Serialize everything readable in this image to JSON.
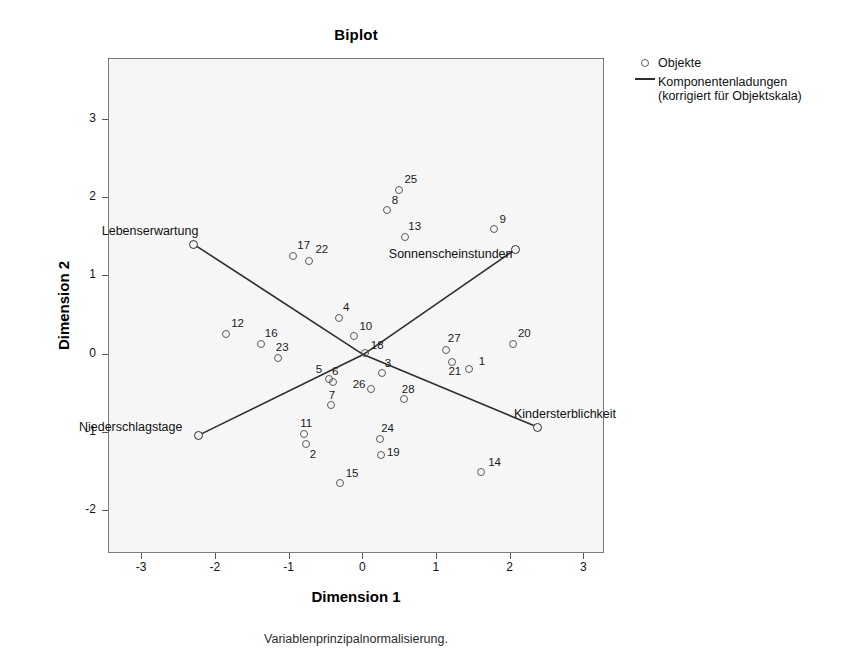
{
  "chart_data": {
    "type": "scatter",
    "title": "Biplot",
    "xlabel": "Dimension 1",
    "ylabel": "Dimension 2",
    "footnote": "Variablenprinzipalnormalisierung.",
    "xlim": [
      -3.45,
      3.28
    ],
    "ylim": [
      -2.55,
      3.78
    ],
    "xticks": [
      -3,
      -2,
      -1,
      0,
      1,
      2,
      3
    ],
    "xticklabels": [
      "-3",
      "-2",
      "-1",
      "0",
      "1",
      "2",
      "3"
    ],
    "yticks": [
      -2,
      -1,
      0,
      1,
      2,
      3
    ],
    "yticklabels": [
      "-2",
      "-1",
      "0",
      "1",
      "2",
      "3"
    ],
    "grid": false,
    "legend_position": "right",
    "legend": [
      {
        "label": "Objekte",
        "marker": "circle-open"
      },
      {
        "label": "Komponentenladungen\n(korrigiert für Objektskala)",
        "marker": "line"
      }
    ],
    "legend_entries": [
      {
        "key": "objekte",
        "label": "Objekte",
        "marker": "circle-open"
      },
      {
        "key": "komponentenladungen",
        "label_line1": "Komponentenladungen",
        "label_line2": "(korrigiert für Objektskala)",
        "marker": "line"
      }
    ],
    "objects": [
      {
        "id": "1",
        "x": 1.43,
        "y": -0.18
      },
      {
        "id": "2",
        "x": -0.78,
        "y": -1.14
      },
      {
        "id": "3",
        "x": 0.25,
        "y": -0.23
      },
      {
        "id": "4",
        "x": -0.33,
        "y": 0.47
      },
      {
        "id": "5",
        "x": -0.47,
        "y": -0.31
      },
      {
        "id": "6",
        "x": -0.41,
        "y": -0.35
      },
      {
        "id": "7",
        "x": -0.44,
        "y": -0.65
      },
      {
        "id": "8",
        "x": 0.32,
        "y": 1.85
      },
      {
        "id": "9",
        "x": 1.78,
        "y": 1.6
      },
      {
        "id": "10",
        "x": -0.12,
        "y": 0.24
      },
      {
        "id": "11",
        "x": -0.8,
        "y": -1.02
      },
      {
        "id": "12",
        "x": -1.86,
        "y": 0.26
      },
      {
        "id": "13",
        "x": 0.57,
        "y": 1.5
      },
      {
        "id": "14",
        "x": 1.6,
        "y": -1.5
      },
      {
        "id": "15",
        "x": -0.32,
        "y": -1.64
      },
      {
        "id": "16",
        "x": -1.39,
        "y": 0.14
      },
      {
        "id": "17",
        "x": -0.95,
        "y": 1.26
      },
      {
        "id": "18",
        "x": 0.02,
        "y": 0.02
      },
      {
        "id": "19",
        "x": 0.24,
        "y": -1.29
      },
      {
        "id": "20",
        "x": 2.03,
        "y": 0.14
      },
      {
        "id": "21",
        "x": 1.21,
        "y": -0.1
      },
      {
        "id": "22",
        "x": -0.73,
        "y": 1.2
      },
      {
        "id": "23",
        "x": -1.16,
        "y": -0.04
      },
      {
        "id": "24",
        "x": 0.23,
        "y": -1.08
      },
      {
        "id": "25",
        "x": 0.49,
        "y": 2.1
      },
      {
        "id": "26",
        "x": 0.1,
        "y": -0.44
      },
      {
        "id": "27",
        "x": 1.12,
        "y": 0.06
      },
      {
        "id": "28",
        "x": 0.55,
        "y": -0.57
      }
    ],
    "object_labels": [
      {
        "id": "1",
        "dx": 10,
        "dy": -14
      },
      {
        "id": "2",
        "dx": 4,
        "dy": 4
      },
      {
        "id": "3",
        "dx": 3,
        "dy": -16
      },
      {
        "id": "4",
        "dx": 4,
        "dy": -17
      },
      {
        "id": "5",
        "dx": -13,
        "dy": -16
      },
      {
        "id": "6",
        "dx": -1,
        "dy": -17
      },
      {
        "id": "7",
        "dx": -2,
        "dy": -16
      },
      {
        "id": "8",
        "dx": 5,
        "dy": -16
      },
      {
        "id": "9",
        "dx": 5,
        "dy": -16
      },
      {
        "id": "10",
        "dx": 5,
        "dy": -16
      },
      {
        "id": "11",
        "dx": -4,
        "dy": -17
      },
      {
        "id": "12",
        "dx": 5,
        "dy": -17
      },
      {
        "id": "13",
        "dx": 3,
        "dy": -17
      },
      {
        "id": "14",
        "dx": 7,
        "dy": -16
      },
      {
        "id": "15",
        "dx": 6,
        "dy": -16
      },
      {
        "id": "16",
        "dx": 4,
        "dy": -17
      },
      {
        "id": "17",
        "dx": 4,
        "dy": -17
      },
      {
        "id": "18",
        "dx": 6,
        "dy": -14
      },
      {
        "id": "19",
        "dx": 6,
        "dy": -9
      },
      {
        "id": "20",
        "dx": 5,
        "dy": -17
      },
      {
        "id": "21",
        "dx": -4,
        "dy": 3
      },
      {
        "id": "22",
        "dx": 6,
        "dy": -18
      },
      {
        "id": "23",
        "dx": -2,
        "dy": -17
      },
      {
        "id": "24",
        "dx": 1,
        "dy": -17
      },
      {
        "id": "25",
        "dx": 5,
        "dy": -17
      },
      {
        "id": "26",
        "dx": -18,
        "dy": -11
      },
      {
        "id": "27",
        "dx": 2,
        "dy": -18
      },
      {
        "id": "28",
        "dx": -2,
        "dy": -16
      }
    ],
    "loadings": [
      {
        "name": "Lebenserwartung",
        "x": -2.3,
        "y": 1.41,
        "label_dx": -92,
        "label_dy": -20
      },
      {
        "name": "Sonnenscheinstunden",
        "x": 2.07,
        "y": 1.35,
        "label_dx": -127,
        "label_dy": -2
      },
      {
        "name": "Niederschlagstage",
        "x": -2.23,
        "y": -1.03,
        "label_dx": -120,
        "label_dy": -15
      },
      {
        "name": "Kindersterblichkeit",
        "x": 2.37,
        "y": -0.93,
        "label_dx": -24,
        "label_dy": -20
      }
    ],
    "loading_origin": {
      "x": 0.0,
      "y": 0.0
    },
    "colors": {
      "plot_background": "#f6f6f6",
      "frame": "#7a7a7a",
      "point_stroke": "#5a5a5a",
      "vector_stroke": "#2e2e2e",
      "text": "#000000"
    }
  }
}
